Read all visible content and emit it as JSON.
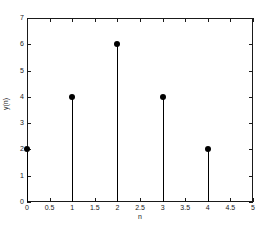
{
  "chart_data": {
    "type": "scatter",
    "plot_style": "stem",
    "title": "",
    "xlabel": "n",
    "ylabel": "y(n)",
    "x": [
      0,
      1,
      2,
      3,
      4
    ],
    "values": [
      2,
      4,
      6,
      4,
      2
    ],
    "xlim": [
      0,
      5
    ],
    "ylim": [
      0,
      7
    ],
    "xticks": [
      0,
      0.5,
      1,
      1.5,
      2,
      2.5,
      3,
      3.5,
      4,
      4.5,
      5
    ],
    "xticklabels": [
      "0",
      "0.5",
      "1",
      "1.5",
      "2",
      "2.5",
      "3",
      "3.5",
      "4",
      "4.5",
      "5"
    ],
    "yticks": [
      0,
      1,
      2,
      3,
      4,
      5,
      6,
      7
    ],
    "yticklabels": [
      "0",
      "1",
      "2",
      "3",
      "4",
      "5",
      "6",
      "7"
    ],
    "grid": false,
    "legend": null,
    "marker": "filled-circle",
    "marker_color": "#000000",
    "line_color": "#000000",
    "axis_color": "#1a1a1a",
    "background": "#ffffff"
  }
}
